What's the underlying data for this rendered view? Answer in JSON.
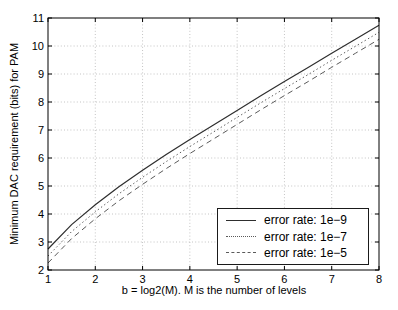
{
  "chart_data": {
    "type": "line",
    "title": "",
    "xlabel": "b = log2(M). M is the number of levels",
    "ylabel": "Minimum DAC requirement (bits) for PAM",
    "xlim": [
      1,
      8
    ],
    "ylim": [
      2,
      11
    ],
    "xticks": [
      1,
      2,
      3,
      4,
      5,
      6,
      7,
      8
    ],
    "yticks": [
      2,
      3,
      4,
      5,
      6,
      7,
      8,
      9,
      10,
      11
    ],
    "grid": true,
    "legend_position": "lower-right",
    "x": [
      1,
      1.5,
      2,
      2.5,
      3,
      3.5,
      4,
      4.5,
      5,
      5.5,
      6,
      6.5,
      7,
      7.5,
      8
    ],
    "series": [
      {
        "name": "error rate: 1e−9",
        "style": "solid",
        "color": "#2e2e2e",
        "values": [
          2.75,
          3.62,
          4.33,
          4.97,
          5.56,
          6.12,
          6.66,
          7.18,
          7.7,
          8.22,
          8.73,
          9.23,
          9.74,
          10.24,
          10.74
        ]
      },
      {
        "name": "error rate: 1e−7",
        "style": "dotted",
        "color": "#5a5a5a",
        "values": [
          2.5,
          3.37,
          4.08,
          4.72,
          5.31,
          5.87,
          6.41,
          6.93,
          7.45,
          7.97,
          8.48,
          8.98,
          9.49,
          9.99,
          10.49
        ]
      },
      {
        "name": "error rate: 1e−5",
        "style": "dashed",
        "color": "#5a5a5a",
        "values": [
          2.25,
          3.12,
          3.83,
          4.47,
          5.06,
          5.62,
          6.16,
          6.68,
          7.2,
          7.72,
          8.23,
          8.73,
          9.24,
          9.74,
          10.24
        ]
      }
    ],
    "colors": {
      "axis": "#000000",
      "grid": "#c4c4c4",
      "tick_label": "#000000",
      "background": "#ffffff"
    }
  }
}
